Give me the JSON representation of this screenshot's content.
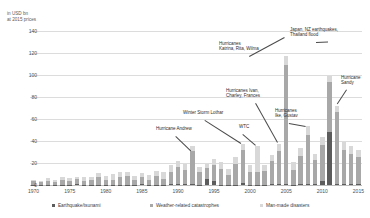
{
  "chart_data": {
    "type": "bar",
    "title": "",
    "subtitle": "",
    "unit_caption": "in USD bn\nat 2015 prices",
    "xlabel": "",
    "ylabel": "",
    "ylim": [
      0,
      145
    ],
    "yticks": [
      0,
      20,
      40,
      60,
      80,
      100,
      120,
      140
    ],
    "xticks": [
      1970,
      1975,
      1980,
      1985,
      1990,
      1995,
      2000,
      2005,
      2010,
      2015
    ],
    "grid": true,
    "legend_position": "bottom",
    "stacked": true,
    "categories": [
      1970,
      1971,
      1972,
      1973,
      1974,
      1975,
      1976,
      1977,
      1978,
      1979,
      1980,
      1981,
      1982,
      1983,
      1984,
      1985,
      1986,
      1987,
      1988,
      1989,
      1990,
      1991,
      1992,
      1993,
      1994,
      1995,
      1996,
      1997,
      1998,
      1999,
      2000,
      2001,
      2002,
      2003,
      2004,
      2005,
      2006,
      2007,
      2008,
      2009,
      2010,
      2011,
      2012,
      2013,
      2014,
      2015
    ],
    "series": [
      {
        "name": "Earthquake/tsunami",
        "color": "#5c5c5c",
        "values": [
          0.3,
          0.2,
          0.3,
          0.2,
          0.3,
          0.2,
          1.2,
          0.2,
          0.3,
          0.3,
          0.3,
          0.3,
          0.3,
          0.3,
          0.3,
          0.5,
          0.3,
          0.3,
          0.3,
          1.0,
          0.5,
          0.6,
          0.5,
          0.4,
          5.0,
          3.5,
          0.4,
          0.4,
          0.4,
          1.5,
          0.4,
          0.4,
          0.4,
          0.5,
          1.0,
          0.5,
          0.4,
          0.5,
          0.5,
          0.5,
          3.5,
          48.0,
          1.0,
          0.8,
          0.8,
          0.8
        ]
      },
      {
        "name": "Weather-related catastrophes",
        "color": "#a8a8a8",
        "values": [
          3.0,
          2.0,
          3.5,
          2.5,
          4.0,
          3.5,
          4.0,
          3.5,
          4.5,
          6.5,
          4.5,
          4.0,
          6.5,
          7.5,
          4.0,
          6.5,
          4.5,
          7.5,
          5.0,
          11.0,
          16.0,
          13.0,
          30.0,
          11.0,
          10.0,
          15.0,
          14.0,
          9.0,
          19.0,
          30.0,
          11.0,
          11.0,
          12.0,
          21.0,
          30.0,
          108.0,
          13.0,
          26.0,
          45.0,
          22.0,
          33.0,
          45.0,
          65.0,
          31.0,
          27.0,
          25.0
        ]
      },
      {
        "name": "Man-made disasters",
        "color": "#d8d8d8",
        "values": [
          1.5,
          1.5,
          2.0,
          2.0,
          2.5,
          2.0,
          2.5,
          3.5,
          2.5,
          3.5,
          3.0,
          5.5,
          4.5,
          3.5,
          3.5,
          4.0,
          4.5,
          4.5,
          6.0,
          6.5,
          5.0,
          5.5,
          5.0,
          4.5,
          4.5,
          5.0,
          6.0,
          5.0,
          6.0,
          5.5,
          6.5,
          24.0,
          6.0,
          6.0,
          6.5,
          8.0,
          7.0,
          7.5,
          8.0,
          6.0,
          7.0,
          6.0,
          6.0,
          7.0,
          7.5,
          6.0
        ]
      }
    ],
    "annotations": [
      {
        "id": "hurricane-andrew",
        "text": "Hurricane Andrew",
        "year": 1992,
        "value": 30
      },
      {
        "id": "winter-storm-lothar",
        "text": "Winter Storm Lothar",
        "year": 1999,
        "value": 37
      },
      {
        "id": "wtc",
        "text": "WTC",
        "year": 2001,
        "value": 35
      },
      {
        "id": "hurricanes-ivan-charley",
        "text": "Hurricanes Ivan,\nCharley, Frances",
        "year": 2004,
        "value": 37
      },
      {
        "id": "hurricanes-katrina-rita",
        "text": "Hurricanes\nKatrina, Rita, Wilma",
        "year": 2005,
        "value": 135
      },
      {
        "id": "hurricanes-ike-gustav",
        "text": "Hurricanes\nIke, Gustav",
        "year": 2008,
        "value": 53
      },
      {
        "id": "japan-nz-earthquakes",
        "text": "Japan, NZ earthquakes,\nThailand flood",
        "year": 2011,
        "value": 130
      },
      {
        "id": "hurricane-sandy",
        "text": "Hurricane\nSandy",
        "year": 2012,
        "value": 72
      }
    ]
  },
  "legend": {
    "items": [
      {
        "id": "earthquake-tsunami",
        "label": "Earthquake/tsunami"
      },
      {
        "id": "weather-related-catastrophes",
        "label": "Weather-related catastrophes"
      },
      {
        "id": "man-made-disasters",
        "label": "Man-made disasters"
      }
    ]
  }
}
